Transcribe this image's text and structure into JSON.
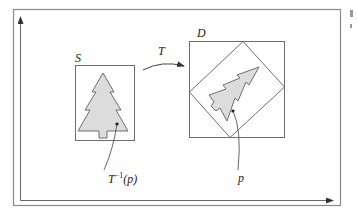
{
  "diagram": {
    "labels": {
      "source_region": "S",
      "target_region": "D",
      "transform": "T",
      "target_point": "p",
      "preimage_point_base": "T",
      "preimage_point_sup": "−1",
      "preimage_point_arg": "(p)"
    },
    "colors": {
      "stroke": "#6e6e6e",
      "frame": "#8a8a8a",
      "fill": "#dcdcdc",
      "axis": "#555555",
      "text": "#222222"
    }
  }
}
